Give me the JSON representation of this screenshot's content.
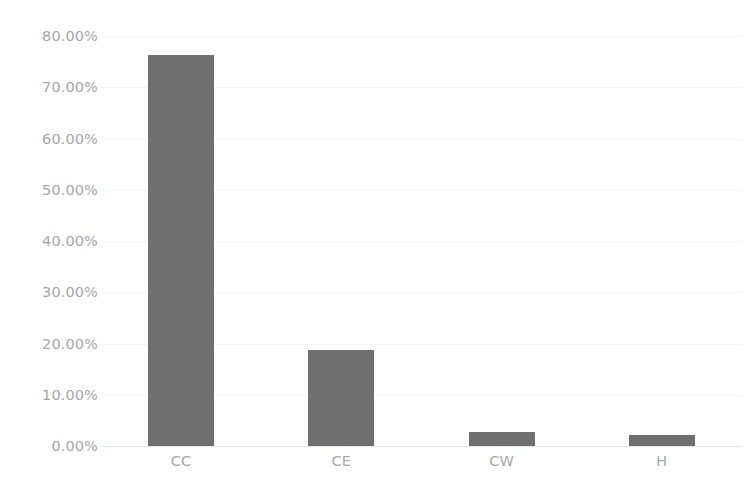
{
  "chart_data": {
    "type": "bar",
    "title": "",
    "subtitle": "",
    "xlabel": "",
    "ylabel": "",
    "categories": [
      "CC",
      "CE",
      "CW",
      "H"
    ],
    "values": [
      76.3,
      18.8,
      2.8,
      2.2
    ],
    "value_labels": [
      "76.30%",
      "18.80%",
      "2.80%",
      "2.20%"
    ],
    "ylim": [
      0,
      80
    ],
    "y_ticks": [
      0,
      10,
      20,
      30,
      40,
      50,
      60,
      70,
      80
    ],
    "y_tick_labels": [
      "0.00%",
      "10.00%",
      "20.00%",
      "30.00%",
      "40.00%",
      "50.00%",
      "60.00%",
      "70.00%",
      "80.00%"
    ],
    "series": [
      {
        "name": "",
        "values": [
          76.3,
          18.8,
          2.8,
          2.2
        ]
      }
    ],
    "grid": true,
    "legend": false,
    "legend_position": "none",
    "bar_color": "#6f6f6f",
    "tick_label_color": "#a6a6a6",
    "gridline_color": "#f4f4f4",
    "background_color": "#ffffff"
  }
}
